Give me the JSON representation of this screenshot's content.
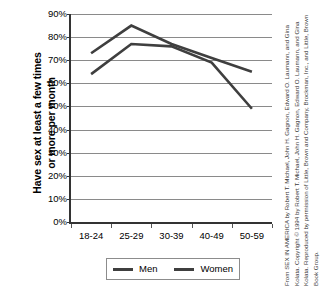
{
  "chart_data": {
    "type": "line",
    "title": "",
    "xlabel": "",
    "ylabel": "Have sex at least a few times\nor more per month",
    "categories": [
      "18-24",
      "25-29",
      "30-39",
      "40-49",
      "50-59"
    ],
    "ylim": [
      0,
      90
    ],
    "ytick_labels": [
      "0%",
      "10%",
      "20%",
      "30%",
      "40%",
      "50%",
      "60%",
      "70%",
      "80%",
      "90%"
    ],
    "ytick_values": [
      0,
      10,
      20,
      30,
      40,
      50,
      60,
      70,
      80,
      90
    ],
    "grid": true,
    "legend_position": "bottom",
    "series": [
      {
        "name": "Men",
        "values": [
          73,
          85,
          77,
          71,
          65
        ],
        "color": "#3f3f3f"
      },
      {
        "name": "Women",
        "values": [
          64,
          77,
          76,
          69,
          49
        ],
        "color": "#3f3f3f"
      }
    ]
  },
  "legend": {
    "men_label": "Men",
    "women_label": "Women"
  },
  "credit": "From SEX IN AMERICA by Robert T. Michael, John H. Gagnon, Edward O. Laumann, and Gina Kolata. Copyright © 1994 by Robert T. Michael, John H. Gagnon, Edward O. Laumann, and Gina Kolata. Reproduced by permission of Little, Brown and Company, Brockman, Inc., and Little, Brown Book Group."
}
